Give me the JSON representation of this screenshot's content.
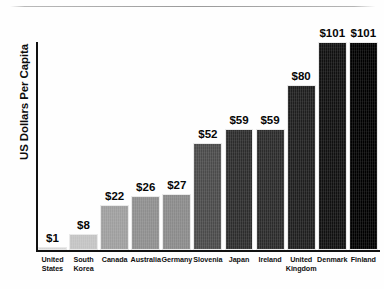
{
  "chart_data": {
    "type": "bar",
    "title": "",
    "subtitle": "",
    "xlabel": "",
    "ylabel": "US Dollars Per Capita",
    "ylim": [
      0,
      110
    ],
    "grid": false,
    "legend": false,
    "orientation": "vertical",
    "value_prefix": "$",
    "categories": [
      "United States",
      "South Korea",
      "Canada",
      "Australia",
      "Germany",
      "Slovenia",
      "Japan",
      "Ireland",
      "United Kingdom",
      "Denmark",
      "Finland"
    ],
    "category_lines": [
      [
        "United",
        "States"
      ],
      [
        "South",
        "Korea"
      ],
      [
        "Canada"
      ],
      [
        "Australia"
      ],
      [
        "Germany"
      ],
      [
        "Slovenia"
      ],
      [
        "Japan"
      ],
      [
        "Ireland"
      ],
      [
        "United",
        "Kingdom"
      ],
      [
        "Denmark"
      ],
      [
        "Finland"
      ]
    ],
    "values": [
      1,
      8,
      22,
      26,
      27,
      52,
      59,
      59,
      80,
      101,
      101
    ],
    "value_labels": [
      "$1",
      "$8",
      "$22",
      "$26",
      "$27",
      "$52",
      "$59",
      "$59",
      "$80",
      "$101",
      "$101"
    ],
    "bar_colors": [
      "#d4d4d4",
      "#c3c3c3",
      "#9e9e9e",
      "#8e8e8e",
      "#8a8a8a",
      "#4a4a4a",
      "#2c2c2c",
      "#2a2a2a",
      "#1e1e1e",
      "#101010",
      "#000000"
    ]
  },
  "axes": {
    "y_axis_color": "#111111",
    "x_axis_color": "#111111"
  },
  "decoration": {
    "top_rule_color": "#9a9a9a"
  }
}
